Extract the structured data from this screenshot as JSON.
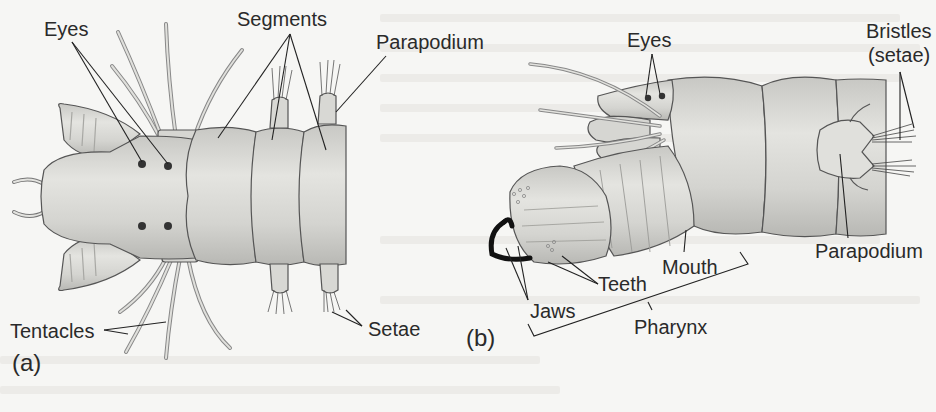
{
  "figure": {
    "panel_a": {
      "letter": "(a)",
      "labels": {
        "eyes": "Eyes",
        "segments": "Segments",
        "parapodium": "Parapodium",
        "tentacles": "Tentacles",
        "setae": "Setae"
      }
    },
    "panel_b": {
      "letter": "(b)",
      "labels": {
        "eyes": "Eyes",
        "bristles_line1": "Bristles",
        "bristles_line2": "(setae)",
        "parapodium": "Parapodium",
        "mouth": "Mouth",
        "teeth": "Teeth",
        "jaws": "Jaws",
        "pharynx": "Pharynx"
      }
    },
    "colors": {
      "background": "#f6f6f4",
      "body_fill": "#dcdcd8",
      "body_shade": "#c4c4c0",
      "outline": "#555555",
      "leader_line": "#222222",
      "jaw": "#111111"
    }
  }
}
